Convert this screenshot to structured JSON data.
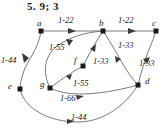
{
  "title": "5.  9; 3",
  "diagram": {
    "type": "directed-graph",
    "stroke_color": "#6b6b6b",
    "node_color": "#1a1a1a",
    "label_color": "#222222",
    "nodes": [
      {
        "id": "a",
        "label": "a",
        "x": 41,
        "y": 31,
        "label_x": 37,
        "label_y": 18
      },
      {
        "id": "b",
        "label": "b",
        "x": 103,
        "y": 31,
        "label_x": 99,
        "label_y": 18
      },
      {
        "id": "c",
        "label": "c",
        "x": 156,
        "y": 31,
        "label_x": 152,
        "label_y": 18
      },
      {
        "id": "f",
        "label": "f",
        "x": 83,
        "y": 66,
        "label_x": 74,
        "label_y": 57
      },
      {
        "id": "d",
        "label": "d",
        "x": 138,
        "y": 85,
        "label_x": 145,
        "label_y": 78
      },
      {
        "id": "g",
        "label": "g",
        "x": 50,
        "y": 88,
        "label_x": 41,
        "label_y": 80
      },
      {
        "id": "e",
        "label": "e",
        "x": 20,
        "y": 89,
        "label_x": 9,
        "label_y": 82
      }
    ],
    "edges": [
      {
        "id": "a-b",
        "from": "a",
        "to": "b",
        "weight": "1-22",
        "label_x": 59,
        "label_y": 16
      },
      {
        "id": "b-c",
        "from": "b",
        "to": "c",
        "weight": "1-22",
        "label_x": 119,
        "label_y": 16
      },
      {
        "id": "a-e",
        "from": "a",
        "to": "e",
        "weight": "1-44",
        "label_x": 2,
        "label_y": 57
      },
      {
        "id": "g-b",
        "from": "g",
        "to": "b",
        "weight": "1-55",
        "label_x": 50,
        "label_y": 44
      },
      {
        "id": "f-b",
        "from": "f",
        "to": "b",
        "weight": "1-33",
        "label_x": 94,
        "label_y": 58
      },
      {
        "id": "b-d",
        "from": "b",
        "to": "d",
        "weight": "1-33",
        "label_x": 119,
        "label_y": 42
      },
      {
        "id": "d-c",
        "from": "d",
        "to": "c",
        "weight": "1-33",
        "label_x": 140,
        "label_y": 60
      },
      {
        "id": "g-f",
        "from": "g",
        "to": "f",
        "weight": "1-55",
        "label_x": 74,
        "label_y": 80
      },
      {
        "id": "g-d",
        "from": "g",
        "to": "d",
        "weight": "1-66",
        "label_x": 61,
        "label_y": 95
      },
      {
        "id": "e-d",
        "from": "e",
        "to": "d",
        "weight": "1-44",
        "label_x": 72,
        "label_y": 114
      }
    ]
  }
}
